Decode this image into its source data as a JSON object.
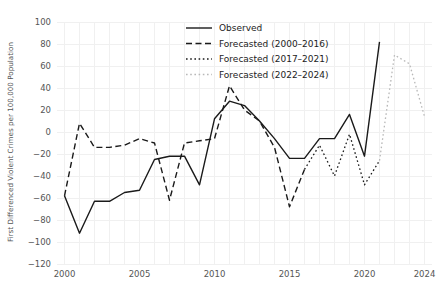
{
  "chart_data": {
    "type": "line",
    "title": "",
    "xlabel": "",
    "ylabel": "First Differenced Violent Crimes per 100,000 Population",
    "xlim": [
      1999.5,
      2024.5
    ],
    "ylim": [
      -120,
      100
    ],
    "grid": true,
    "legend_position": "top-right",
    "x_ticks": [
      "2000",
      "2005",
      "2010",
      "2015",
      "2020",
      "2024"
    ],
    "x_tick_values": [
      2000,
      2005,
      2010,
      2015,
      2020,
      2024
    ],
    "y_ticks": [
      "100",
      "80",
      "60",
      "40",
      "20",
      "0",
      "-20",
      "-40",
      "-60",
      "-80",
      "-100",
      "-120"
    ],
    "y_tick_values": [
      100,
      80,
      60,
      40,
      20,
      0,
      -20,
      -40,
      -60,
      -80,
      -100,
      -120
    ],
    "series": [
      {
        "name": "Observed",
        "style": "solid",
        "color": "#1a1a1a",
        "width": 1.4,
        "x": [
          2000,
          2001,
          2002,
          2003,
          2004,
          2005,
          2006,
          2007,
          2008,
          2009,
          2010,
          2011,
          2012,
          2013,
          2014,
          2015,
          2016,
          2017,
          2018,
          2019,
          2020,
          2021
        ],
        "values": [
          -58,
          -92,
          -63,
          -63,
          -55,
          -53,
          -25,
          -22,
          -22,
          -48,
          12,
          28,
          24,
          10,
          -6,
          -24,
          -24,
          -6,
          -6,
          16,
          -22,
          82
        ]
      },
      {
        "name": "Forecasted (2000–2016)",
        "style": "dashed",
        "color": "#1a1a1a",
        "width": 1.4,
        "x": [
          2000,
          2001,
          2002,
          2003,
          2004,
          2005,
          2006,
          2007,
          2008,
          2009,
          2010,
          2011,
          2012,
          2013,
          2014,
          2015,
          2016
        ],
        "values": [
          -58,
          8,
          -14,
          -14,
          -12,
          -6,
          -10,
          -62,
          -10,
          -8,
          -6,
          42,
          20,
          10,
          -14,
          -68,
          -34
        ]
      },
      {
        "name": "Forecasted (2017–2021)",
        "style": "dotted",
        "color": "#1a1a1a",
        "width": 1.3,
        "x": [
          2016,
          2017,
          2018,
          2019,
          2020,
          2021
        ],
        "values": [
          -34,
          -12,
          -40,
          -2,
          -48,
          -26
        ]
      },
      {
        "name": "Forecasted (2022–2024)",
        "style": "dotted-light",
        "color": "#b8b8b8",
        "width": 1.3,
        "x": [
          2021,
          2022,
          2023,
          2024
        ],
        "values": [
          -26,
          70,
          62,
          14
        ]
      }
    ]
  },
  "legend": {
    "items": [
      {
        "label": "Observed"
      },
      {
        "label": "Forecasted (2000–2016)"
      },
      {
        "label": "Forecasted (2017–2021)"
      },
      {
        "label": "Forecasted (2022–2024)"
      }
    ]
  }
}
